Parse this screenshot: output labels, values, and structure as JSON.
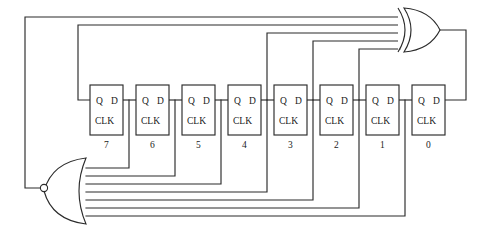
{
  "diagram": {
    "type": "logic-circuit-schematic",
    "background_color": "#ffffff",
    "line_color": "#2b2b2b"
  },
  "flipflops": [
    {
      "index": 7,
      "label": "7",
      "q_label": "Q",
      "d_label": "D",
      "clk_label": "CLK",
      "x": 90,
      "y": 85,
      "w": 33,
      "h": 50
    },
    {
      "index": 6,
      "label": "6",
      "q_label": "Q",
      "d_label": "D",
      "clk_label": "CLK",
      "x": 136,
      "y": 85,
      "w": 33,
      "h": 50
    },
    {
      "index": 5,
      "label": "5",
      "q_label": "Q",
      "d_label": "D",
      "clk_label": "CLK",
      "x": 182,
      "y": 85,
      "w": 33,
      "h": 50
    },
    {
      "index": 4,
      "label": "4",
      "q_label": "Q",
      "d_label": "D",
      "clk_label": "CLK",
      "x": 228,
      "y": 85,
      "w": 33,
      "h": 50
    },
    {
      "index": 3,
      "label": "3",
      "q_label": "Q",
      "d_label": "D",
      "clk_label": "CLK",
      "x": 274,
      "y": 85,
      "w": 33,
      "h": 50
    },
    {
      "index": 2,
      "label": "2",
      "q_label": "Q",
      "d_label": "D",
      "clk_label": "CLK",
      "x": 320,
      "y": 85,
      "w": 33,
      "h": 50
    },
    {
      "index": 1,
      "label": "1",
      "q_label": "Q",
      "d_label": "D",
      "clk_label": "CLK",
      "x": 366,
      "y": 85,
      "w": 33,
      "h": 50
    },
    {
      "index": 0,
      "label": "0",
      "q_label": "D",
      "d_label": "D",
      "clk_label": "CLK",
      "x": 412,
      "y": 85,
      "w": 33,
      "h": 50
    }
  ],
  "gates": [
    {
      "name": "xor-gate",
      "type": "XOR",
      "orientation": "right",
      "input_count": 4,
      "x": 400,
      "y": 8,
      "w": 40,
      "h": 44,
      "description": "Feedback XOR combining four register taps"
    },
    {
      "name": "nor-gate",
      "type": "NOR",
      "orientation": "left",
      "input_count": 8,
      "inverted_output": true,
      "x": 38,
      "y": 158,
      "w": 48,
      "h": 66,
      "description": "All-zeros detector NOR gate driving XOR feedback path"
    }
  ],
  "labels": {
    "q": "Q",
    "d": "D",
    "clk": "CLK"
  },
  "bus": {
    "xor_input_rows_y": [
      17,
      25,
      33,
      41
    ],
    "nor_input_rows_y": [
      168,
      176,
      184,
      192,
      200,
      208,
      216
    ],
    "chain_y": 100
  }
}
